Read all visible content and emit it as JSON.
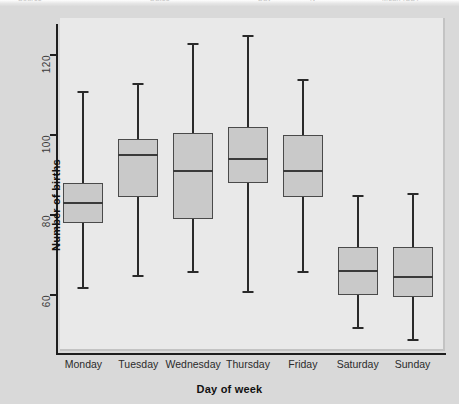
{
  "page": {
    "top_sliver_fragments": [
      "Source",
      "Dates",
      "Day",
      "N",
      "Mean (SD)"
    ]
  },
  "chart_data": {
    "type": "box",
    "title": "",
    "xlabel": "Day of week",
    "ylabel": "Number of births",
    "ylim": [
      45,
      128
    ],
    "yticks": [
      60,
      80,
      100,
      120
    ],
    "ytick_labels": [
      "60",
      "80",
      "100",
      "120"
    ],
    "grid": false,
    "legend": "none",
    "categories": [
      "Monday",
      "Tuesday",
      "Wednesday",
      "Thursday",
      "Friday",
      "Saturday",
      "Sunday"
    ],
    "boxes": [
      {
        "category": "Monday",
        "whisker_low": 62,
        "q1": 78,
        "median": 83,
        "q3": 88,
        "whisker_high": 111
      },
      {
        "category": "Tuesday",
        "whisker_low": 65,
        "q1": 84.5,
        "median": 95,
        "q3": 99,
        "whisker_high": 113
      },
      {
        "category": "Wednesday",
        "whisker_low": 66,
        "q1": 79,
        "median": 91,
        "q3": 100.5,
        "whisker_high": 123
      },
      {
        "category": "Thursday",
        "whisker_low": 61,
        "q1": 88,
        "median": 94,
        "q3": 102,
        "whisker_high": 125
      },
      {
        "category": "Friday",
        "whisker_low": 66,
        "q1": 84.5,
        "median": 91,
        "q3": 100,
        "whisker_high": 114
      },
      {
        "category": "Saturday",
        "whisker_low": 52,
        "q1": 60,
        "median": 66,
        "q3": 72,
        "whisker_high": 85
      },
      {
        "category": "Sunday",
        "whisker_low": 49,
        "q1": 59.5,
        "median": 64.5,
        "q3": 72,
        "whisker_high": 85.5
      }
    ],
    "colors": {
      "box_fill": "#c9c9c9",
      "box_edge": "#4a4a4a",
      "whisker": "#2a2a2a",
      "median": "#3a3a3a",
      "axis": "#1d1d1d",
      "plot_background": "#e9e9e9",
      "figure_background": "#d9d9d9"
    }
  }
}
